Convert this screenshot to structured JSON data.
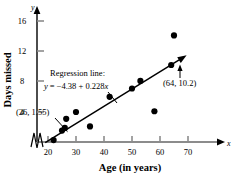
{
  "chart_data": {
    "type": "scatter",
    "title": "",
    "xlabel": "Age (in years)",
    "ylabel": "Days missed",
    "x_axis_name": "x",
    "y_axis_name": "y",
    "xlim": [
      15,
      75
    ],
    "ylim": [
      0,
      18
    ],
    "xticks": [
      20,
      30,
      40,
      50,
      60,
      70
    ],
    "yticks": [
      4,
      8,
      12,
      16
    ],
    "grid": false,
    "axis_break": true,
    "legend": null,
    "points": [
      {
        "x": 22,
        "y": 0.3
      },
      {
        "x": 25,
        "y": 1.55
      },
      {
        "x": 26,
        "y": 1.9
      },
      {
        "x": 26.5,
        "y": 3.1
      },
      {
        "x": 30,
        "y": 4.0
      },
      {
        "x": 35,
        "y": 2.1
      },
      {
        "x": 42,
        "y": 6.0
      },
      {
        "x": 50,
        "y": 7.1
      },
      {
        "x": 53,
        "y": 8.1
      },
      {
        "x": 58,
        "y": 4.1
      },
      {
        "x": 64,
        "y": 10.2
      },
      {
        "x": 65,
        "y": 14.1
      }
    ],
    "regression": {
      "label": "Regression line:",
      "equation_prefix": "y",
      "equation": "y = −4.38 + 0.228x",
      "equation_rhs": "= −4.38 + 0.228",
      "equation_var": "x",
      "intercept": -4.38,
      "slope": 0.228,
      "x_start": 19,
      "x_end": 68
    },
    "annotations": [
      {
        "name": "point-label-low",
        "text": "(26, 1.55)",
        "point_x": 26,
        "point_y": 1.55
      },
      {
        "name": "point-label-high",
        "text": "(64, 10.2)",
        "point_x": 64,
        "point_y": 10.2
      }
    ]
  }
}
